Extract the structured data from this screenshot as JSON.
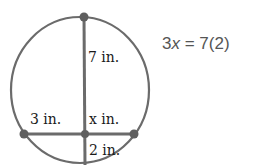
{
  "diagram": {
    "type": "intersecting-chords-in-circle",
    "colors": {
      "stroke": "#6b6b6b",
      "point": "#5f5f5f",
      "text": "#1a1a1a",
      "equation": "#555555"
    },
    "labels": {
      "upper_segment": "7 in.",
      "left_segment": "3 in.",
      "right_segment": "x in.",
      "lower_segment": "2 in."
    },
    "equation": {
      "coef": "3",
      "var": "x",
      "rhs": " = 7(2)"
    }
  }
}
